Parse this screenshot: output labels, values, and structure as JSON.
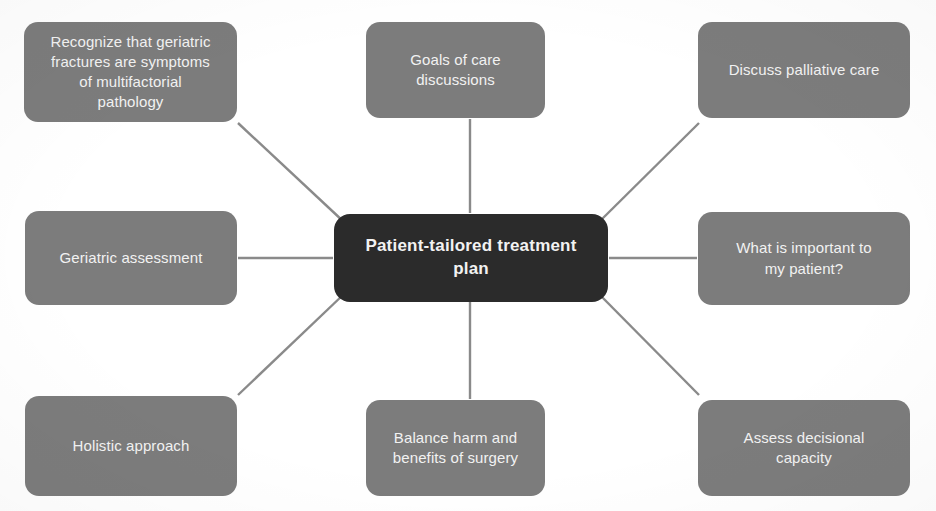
{
  "diagram": {
    "title": "Patient-tailored treatment plan",
    "type": "hub-and-spoke",
    "center": {
      "id": "center",
      "label": "Patient-tailored treatment plan",
      "color": "#2b2b2b",
      "text_color": "#f2f2f2",
      "x": 334,
      "y": 214,
      "width": 274,
      "height": 88
    },
    "node_color": "#7c7c7c",
    "node_text_color": "#f2f2f2",
    "connector_color": "#8a8a8a",
    "background_color": "#ffffff",
    "nodes": [
      {
        "id": "node-recognize-geriatric-fractures",
        "label": "Recognize that geriatric\nfractures are symptoms\nof multifactorial\npathology",
        "position": "top-left",
        "x": 24,
        "y": 22,
        "width": 213,
        "height": 100
      },
      {
        "id": "node-goals-of-care",
        "label": "Goals of care\ndiscussions",
        "position": "top-center",
        "x": 366,
        "y": 22,
        "width": 179,
        "height": 96
      },
      {
        "id": "node-palliative-care",
        "label": "Discuss palliative care",
        "position": "top-right",
        "x": 698,
        "y": 22,
        "width": 212,
        "height": 96
      },
      {
        "id": "node-geriatric-assessment",
        "label": "Geriatric assessment",
        "position": "middle-left",
        "x": 25,
        "y": 211,
        "width": 212,
        "height": 94
      },
      {
        "id": "node-what-is-important",
        "label": "What is important to\nmy patient?",
        "position": "middle-right",
        "x": 698,
        "y": 212,
        "width": 212,
        "height": 93
      },
      {
        "id": "node-holistic-approach",
        "label": "Holistic approach",
        "position": "bottom-left",
        "x": 25,
        "y": 396,
        "width": 212,
        "height": 100
      },
      {
        "id": "node-balance-harm-benefits",
        "label": "Balance harm and\nbenefits of surgery",
        "position": "bottom-center",
        "x": 366,
        "y": 400,
        "width": 179,
        "height": 96
      },
      {
        "id": "node-decisional-capacity",
        "label": "Assess decisional\ncapacity",
        "position": "bottom-right",
        "x": 698,
        "y": 400,
        "width": 212,
        "height": 96
      }
    ],
    "connectors": [
      {
        "id": "edge-center-to-top-left",
        "from": "center",
        "to": "node-recognize-geriatric-fractures",
        "x1": 344,
        "y1": 222,
        "x2": 238,
        "y2": 123
      },
      {
        "id": "edge-center-to-top-center",
        "from": "center",
        "to": "node-goals-of-care",
        "x1": 470,
        "y1": 213,
        "x2": 470,
        "y2": 119
      },
      {
        "id": "edge-center-to-top-right",
        "from": "center",
        "to": "node-palliative-care",
        "x1": 599,
        "y1": 222,
        "x2": 699,
        "y2": 123
      },
      {
        "id": "edge-center-to-middle-left",
        "from": "center",
        "to": "node-geriatric-assessment",
        "x1": 333,
        "y1": 258,
        "x2": 238,
        "y2": 258
      },
      {
        "id": "edge-center-to-middle-right",
        "from": "center",
        "to": "node-what-is-important",
        "x1": 609,
        "y1": 258,
        "x2": 697,
        "y2": 258
      },
      {
        "id": "edge-center-to-bottom-left",
        "from": "center",
        "to": "node-holistic-approach",
        "x1": 344,
        "y1": 294,
        "x2": 238,
        "y2": 395
      },
      {
        "id": "edge-center-to-bottom-center",
        "from": "center",
        "to": "node-balance-harm-benefits",
        "x1": 470,
        "y1": 302,
        "x2": 470,
        "y2": 399
      },
      {
        "id": "edge-center-to-bottom-right",
        "from": "center",
        "to": "node-decisional-capacity",
        "x1": 599,
        "y1": 294,
        "x2": 699,
        "y2": 395
      }
    ]
  }
}
